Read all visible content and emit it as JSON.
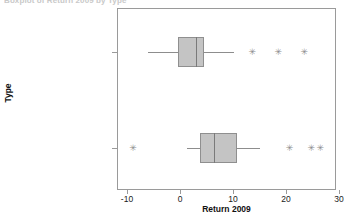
{
  "title_clipped": "Boxplot of Return 2009 by Type",
  "axes": {
    "x_title": "Return 2009",
    "y_title": "Type",
    "x_ticks": [
      {
        "label": "-10",
        "value": -10
      },
      {
        "label": "0",
        "value": 0
      },
      {
        "label": "10",
        "value": 10
      },
      {
        "label": "20",
        "value": 20
      },
      {
        "label": "30",
        "value": 30
      }
    ],
    "categories": [
      "Intermediate Government",
      "Short Term Corporate"
    ]
  },
  "chart_data": {
    "type": "box",
    "orientation": "horizontal",
    "title": "Boxplot of Return 2009 by Type",
    "xlabel": "Return 2009",
    "ylabel": "Type",
    "xlim": [
      -13.5,
      29.5
    ],
    "x_ticks": [
      -10,
      0,
      10,
      20,
      30
    ],
    "grid": false,
    "legend": "none",
    "categories": [
      "Intermediate Government",
      "Short Term Corporate"
    ],
    "boxes": [
      {
        "category": "Intermediate Government",
        "whisker_low": -6.0,
        "q1": -0.4,
        "median": 3.0,
        "q3": 4.5,
        "whisker_high": 10.2,
        "outliers": [
          13.6,
          18.5,
          23.4
        ]
      },
      {
        "category": "Short Term Corporate",
        "whisker_low": 1.3,
        "q1": 3.8,
        "median": 6.4,
        "q3": 10.8,
        "whisker_high": 15.1,
        "outliers": [
          -8.9,
          20.6,
          24.7,
          26.4
        ]
      }
    ]
  },
  "style": {
    "box_fill": "#c4c4c4",
    "box_stroke": "#8f8f8f",
    "whisker_color": "#8d8d8d",
    "frame_color": "#9a9a9a",
    "outlier_glyph": "✳"
  }
}
